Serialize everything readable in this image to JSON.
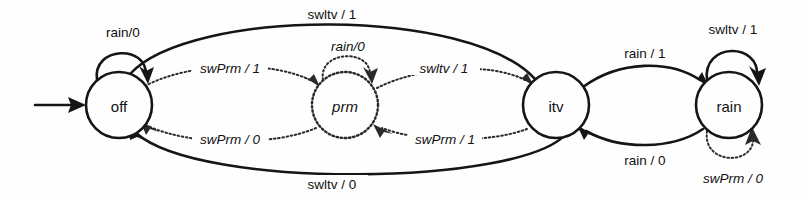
{
  "diagram": {
    "type": "finite-state-machine",
    "states": [
      {
        "id": "off",
        "label": "off",
        "style": "solid",
        "italic": false,
        "cx": 119,
        "cy": 105,
        "r": 33
      },
      {
        "id": "prm",
        "label": "prm",
        "style": "dotted",
        "italic": true,
        "cx": 345,
        "cy": 105,
        "r": 33
      },
      {
        "id": "itv",
        "label": "itv",
        "style": "solid",
        "italic": false,
        "cx": 556,
        "cy": 105,
        "r": 33
      },
      {
        "id": "rain",
        "label": "rain",
        "style": "solid",
        "italic": false,
        "cx": 729,
        "cy": 105,
        "r": 33
      }
    ],
    "initial_state": "off",
    "transitions": [
      {
        "id": "off-self",
        "from": "off",
        "to": "off",
        "label": "rain/0",
        "style": "solid",
        "italic": false
      },
      {
        "id": "prm-self",
        "from": "prm",
        "to": "prm",
        "label": "rain/0",
        "style": "dotted",
        "italic": true
      },
      {
        "id": "rain-self-top",
        "from": "rain",
        "to": "rain",
        "label": "swltv / 1",
        "style": "solid",
        "italic": false
      },
      {
        "id": "rain-self-bot",
        "from": "rain",
        "to": "rain",
        "label": "swPrm / 0",
        "style": "dotted",
        "italic": true
      },
      {
        "id": "off-to-itv",
        "from": "off",
        "to": "itv",
        "label": "swltv / 1",
        "style": "solid",
        "italic": false
      },
      {
        "id": "itv-to-off",
        "from": "itv",
        "to": "off",
        "label": "swltv / 0",
        "style": "solid",
        "italic": false
      },
      {
        "id": "off-to-prm",
        "from": "off",
        "to": "prm",
        "label": "swPrm / 1",
        "style": "dotted",
        "italic": true
      },
      {
        "id": "prm-to-off",
        "from": "prm",
        "to": "off",
        "label": "swPrm / 0",
        "style": "dotted",
        "italic": true
      },
      {
        "id": "prm-to-itv",
        "from": "prm",
        "to": "itv",
        "label": "swltv / 1",
        "style": "dotted",
        "italic": true
      },
      {
        "id": "itv-to-prm",
        "from": "itv",
        "to": "prm",
        "label": "swPrm / 1",
        "style": "dotted",
        "italic": true
      },
      {
        "id": "itv-to-rain",
        "from": "itv",
        "to": "rain",
        "label": "rain / 1",
        "style": "solid",
        "italic": false
      },
      {
        "id": "rain-to-itv",
        "from": "rain",
        "to": "itv",
        "label": "rain / 0",
        "style": "solid",
        "italic": false
      }
    ],
    "colors": {
      "solid_stroke": "#151515",
      "dotted_stroke": "#2a2a2a",
      "background": "#fefefe",
      "text": "#111111"
    }
  }
}
